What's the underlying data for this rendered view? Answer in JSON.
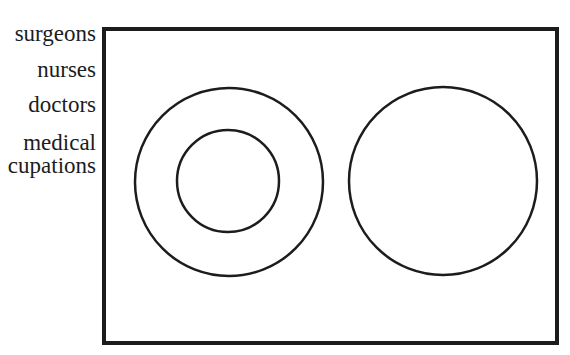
{
  "labels": [
    {
      "text": "surgeons"
    },
    {
      "text": "nurses"
    },
    {
      "text": "doctors"
    },
    {
      "text": "medical"
    },
    {
      "text": "cupations"
    }
  ],
  "colors": {
    "stroke": "#1c1c1c",
    "background": "#ffffff",
    "text": "#1c1c1c"
  },
  "diagram": {
    "type": "euler",
    "universe_box": {
      "x": 104,
      "y": 29,
      "width": 453,
      "height": 314
    },
    "circles": [
      {
        "id": "outer-left",
        "cx": 229,
        "cy": 182,
        "r": 94
      },
      {
        "id": "inner-left",
        "cx": 228,
        "cy": 181,
        "r": 51
      },
      {
        "id": "right",
        "cx": 443,
        "cy": 181,
        "r": 94
      }
    ]
  }
}
